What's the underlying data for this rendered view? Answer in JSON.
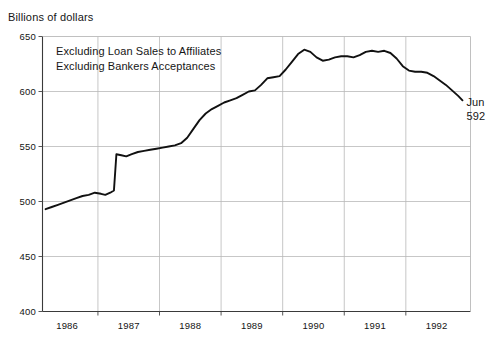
{
  "header": {
    "axis_title": "Billions of dollars",
    "clipped_top_text": ""
  },
  "annotations": {
    "note_line_1": "Excluding Loan Sales to Affiliates",
    "note_line_2": "Excluding Bankers Acceptances",
    "endpoint_month": "Jun",
    "endpoint_value": "592"
  },
  "style": {
    "line_color": "#111111",
    "grid_color": "#b9b9b9",
    "frame_color": "#555555",
    "background": "#ffffff"
  },
  "chart_data": {
    "type": "line",
    "title": "",
    "subtitle": "",
    "xlabel": "",
    "ylabel": "Billions of dollars",
    "ylim": [
      400,
      650
    ],
    "xlim": [
      1985.6,
      1992.55
    ],
    "yticks": [
      400,
      450,
      500,
      550,
      600,
      650
    ],
    "ytick_labels": [
      "400",
      "450",
      "500",
      "550",
      "600",
      "650"
    ],
    "xtick_labels": [
      "1986",
      "1987",
      "1988",
      "1989",
      "1990",
      "1991",
      "1992"
    ],
    "xtick_values": [
      1986,
      1987,
      1988,
      1989,
      1990,
      1991,
      1992
    ],
    "gridlines": {
      "horizontal": true,
      "vertical": true,
      "vertical_at": [
        1986.5,
        1987.5,
        1988.5,
        1989.5,
        1990.5,
        1991.5
      ]
    },
    "legend": null,
    "legend_position": "none",
    "notes": [
      "Excluding Loan Sales to Affiliates",
      "Excluding Bankers Acceptances"
    ],
    "point_annotations": [
      {
        "label": "Jun",
        "value": 592,
        "x": 1992.42
      }
    ],
    "series": [
      {
        "name": "Commercial and industrial loans",
        "color": "#111111",
        "x": [
          1985.65,
          1985.75,
          1985.85,
          1985.95,
          1986.05,
          1986.15,
          1986.25,
          1986.35,
          1986.45,
          1986.55,
          1986.62,
          1986.7,
          1986.76,
          1986.8,
          1986.88,
          1986.96,
          1987.05,
          1987.15,
          1987.25,
          1987.35,
          1987.45,
          1987.55,
          1987.65,
          1987.75,
          1987.85,
          1987.95,
          1988.05,
          1988.15,
          1988.25,
          1988.35,
          1988.45,
          1988.55,
          1988.65,
          1988.75,
          1988.85,
          1988.95,
          1989.05,
          1989.15,
          1989.25,
          1989.35,
          1989.45,
          1989.55,
          1989.65,
          1989.75,
          1989.85,
          1989.95,
          1990.05,
          1990.15,
          1990.25,
          1990.35,
          1990.45,
          1990.55,
          1990.65,
          1990.75,
          1990.85,
          1990.95,
          1991.05,
          1991.15,
          1991.25,
          1991.35,
          1991.45,
          1991.55,
          1991.65,
          1991.75,
          1991.85,
          1991.95,
          1992.05,
          1992.15,
          1992.25,
          1992.35,
          1992.42
        ],
        "y": [
          493,
          495,
          497,
          499,
          501,
          503,
          505,
          506,
          508,
          507,
          506,
          508,
          510,
          543,
          542,
          541,
          543,
          545,
          546,
          547,
          548,
          549,
          550,
          551,
          553,
          558,
          566,
          574,
          580,
          584,
          587,
          590,
          592,
          594,
          597,
          600,
          601,
          606,
          612,
          613,
          614,
          620,
          627,
          634,
          638,
          636,
          631,
          628,
          629,
          631,
          632,
          632,
          631,
          633,
          636,
          637,
          636,
          637,
          635,
          630,
          623,
          619,
          618,
          618,
          617,
          614,
          610,
          606,
          601,
          596,
          592
        ]
      }
    ]
  }
}
